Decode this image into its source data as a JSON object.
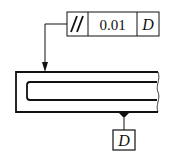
{
  "diagram": {
    "type": "gd&t-parallelism-callout",
    "feature_control_frame": {
      "symbol": "//",
      "symbol_name": "parallelism",
      "tolerance": "0.01",
      "datum_reference": "D"
    },
    "datum_feature": {
      "label": "D"
    },
    "colors": {
      "line": "#111111",
      "background": "#ffffff"
    }
  }
}
